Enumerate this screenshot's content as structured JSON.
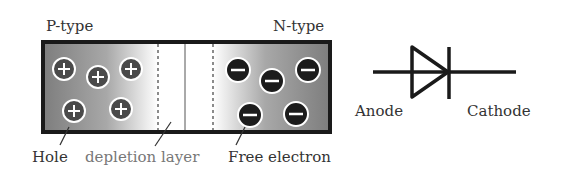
{
  "diagram": {
    "labels": {
      "p_type": "P-type",
      "n_type": "N-type",
      "hole": "Hole",
      "depletion_layer": "depletion layer",
      "free_electron": "Free electron",
      "anode": "Anode",
      "cathode": "Cathode"
    },
    "holes": [
      {
        "x": 64,
        "y": 69,
        "symbol": "+"
      },
      {
        "x": 98,
        "y": 77,
        "symbol": "+"
      },
      {
        "x": 131,
        "y": 69,
        "symbol": "+"
      },
      {
        "x": 74,
        "y": 111,
        "symbol": "+"
      },
      {
        "x": 121,
        "y": 109,
        "symbol": "+"
      }
    ],
    "electrons": [
      {
        "x": 238,
        "y": 70,
        "symbol": "-"
      },
      {
        "x": 272,
        "y": 81,
        "symbol": "-"
      },
      {
        "x": 308,
        "y": 70,
        "symbol": "-"
      },
      {
        "x": 250,
        "y": 115,
        "symbol": "-"
      },
      {
        "x": 296,
        "y": 114,
        "symbol": "-"
      }
    ],
    "colors": {
      "border": "#1a1a1a",
      "region_dark": "#8a8a8a",
      "hole_fill": "#4a4a4a",
      "electron_fill": "#1c1c1c",
      "label": "#333333",
      "label_light": "#777777"
    }
  }
}
